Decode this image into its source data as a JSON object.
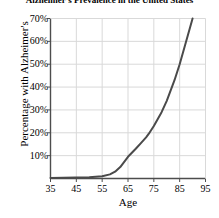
{
  "chart_data": {
    "type": "line",
    "title": "Alzheimer's Prevalence in the United States",
    "xlabel": "Age",
    "ylabel": "Percentage with Alzheimer's",
    "xlim": [
      35,
      95
    ],
    "ylim": [
      0,
      70
    ],
    "grid": true,
    "legend": false,
    "line_color": "#4a4a4a",
    "grid_color": "#d9d9d9",
    "axis_color": "#4d4d4d",
    "xticks": [
      35,
      45,
      55,
      65,
      75,
      85,
      95
    ],
    "xtick_labels": [
      "35",
      "45",
      "55",
      "65",
      "75",
      "85",
      "95"
    ],
    "yticks": [
      10,
      20,
      30,
      40,
      50,
      60,
      70
    ],
    "ytick_labels": [
      "10%",
      "20%",
      "30%",
      "40%",
      "50%",
      "60%",
      "70%"
    ],
    "series": [
      {
        "name": "Percentage with Alzheimer's",
        "x": [
          35,
          40,
          45,
          50,
          55,
          58,
          60,
          62,
          65,
          68,
          70,
          72,
          73,
          75,
          78,
          80,
          83,
          85,
          87,
          90
        ],
        "values": [
          0.2,
          0.3,
          0.4,
          0.6,
          1.0,
          1.8,
          3.0,
          5.0,
          9.5,
          13.0,
          15.5,
          18.0,
          19.5,
          23.0,
          29.0,
          34.0,
          43.0,
          50.0,
          58.0,
          70.0
        ]
      }
    ]
  }
}
